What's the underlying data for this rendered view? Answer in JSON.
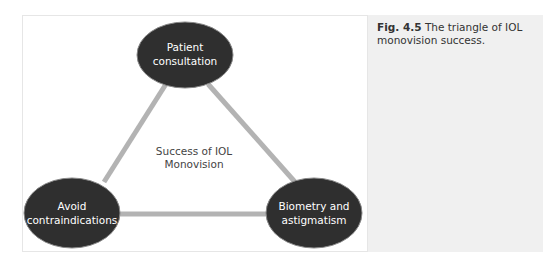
{
  "caption": {
    "label": "Fig. 4.5",
    "text": "The triangle of IOL monovision success."
  },
  "diagram": {
    "center": {
      "line1": "Success of IOL",
      "line2": "Monovision"
    },
    "nodes": [
      {
        "id": "top",
        "line1": "Patient",
        "line2": "consultation"
      },
      {
        "id": "bottom-left",
        "line1": "Avoid",
        "line2": "contraindications"
      },
      {
        "id": "bottom-right",
        "line1": "Biometry and",
        "line2": "astigmatism"
      }
    ],
    "colors": {
      "node_fill": "#2f2f2f",
      "edge": "#b3b3b3",
      "caption_bg": "#f0f0f0"
    }
  }
}
